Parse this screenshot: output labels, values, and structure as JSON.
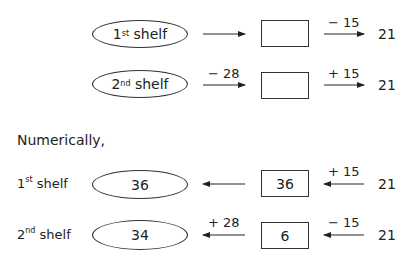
{
  "top_diagram": {
    "rows": [
      {
        "ellipse_label_num": "1",
        "ellipse_label_sup": "st",
        "ellipse_label_text": " shelf",
        "first_op": "",
        "box_value": "",
        "second_op": "− 15",
        "end_value": "21"
      },
      {
        "ellipse_label_num": "2",
        "ellipse_label_sup": "nd",
        "ellipse_label_text": " shelf",
        "first_op": "− 28",
        "box_value": "",
        "second_op": "+ 15",
        "end_value": "21"
      }
    ]
  },
  "section_heading": "Numerically,",
  "bottom_diagram": {
    "rows": [
      {
        "label_num": "1",
        "label_sup": "st",
        "label_text": " shelf",
        "ellipse_value": "36",
        "first_op": "",
        "box_value": "36",
        "second_op": "+ 15",
        "end_value": "21"
      },
      {
        "label_num": "2",
        "label_sup": "nd",
        "label_text": " shelf",
        "ellipse_value": "34",
        "first_op": "+ 28",
        "box_value": "6",
        "second_op": "− 15",
        "end_value": "21"
      }
    ]
  }
}
